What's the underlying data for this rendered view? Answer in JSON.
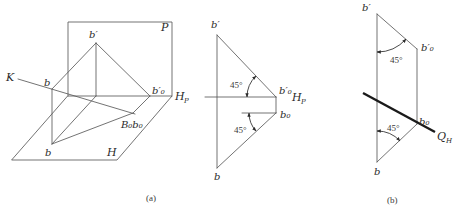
{
  "figure": {
    "panel_a": {
      "caption": "(a)",
      "pictorial": {
        "plane_v_label": "P",
        "plane_h_label": "H",
        "axis_label_main": "H",
        "axis_label_sub": "P",
        "axis_line_label": "K",
        "point_space_label": "b",
        "point_v_label": "b′",
        "point_v_rotated_label": "b′₀",
        "point_rotated_label": "B₀b₀",
        "point_h_label": "b"
      },
      "projection": {
        "point_v_label": "b′",
        "point_v_rotated_label": "b′₀",
        "axis_label_main": "H",
        "axis_label_sub": "P",
        "point_h_rotated_label": "b₀",
        "point_h_label": "b",
        "angle_upper": "45°",
        "angle_lower": "45°"
      }
    },
    "panel_b": {
      "caption": "(b)",
      "point_v_label": "b′",
      "point_v_rotated_label": "b′₀",
      "angle_upper": "45°",
      "point_h_rotated_label": "b₀",
      "trace_label_main": "Q",
      "trace_label_sub": "H",
      "angle_lower": "45°",
      "point_h_label": "b"
    },
    "colors": {
      "line": "#5a5a5a",
      "trace_line": "#1a1a1a",
      "background": "#ffffff"
    }
  }
}
